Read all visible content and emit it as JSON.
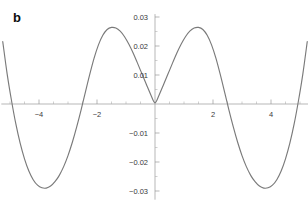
{
  "panel": {
    "label": "b"
  },
  "chart_data": {
    "type": "line",
    "title": "",
    "xlabel": "",
    "ylabel": "",
    "xlim": [
      -5.3,
      5.3
    ],
    "ylim": [
      -0.033,
      0.031
    ],
    "grid": false,
    "legend": null,
    "xticks": [
      -4,
      -2,
      2,
      4
    ],
    "xtick_labels": [
      "−4",
      "−2",
      "2",
      "4"
    ],
    "xtick_minor_step": 0.5,
    "yticks": [
      0.03,
      0.02,
      0.01,
      -0.01,
      -0.02,
      -0.03
    ],
    "ytick_labels": [
      "0.03",
      "0.02",
      "0.01",
      "−0.01",
      "−0.02",
      "−0.03"
    ],
    "ytick_minor_step": 0.005,
    "axis_color": "#9a9a9a",
    "curve_color": "#7a7a7a",
    "series": [
      {
        "name": "curve",
        "x": [
          -5.25,
          -5.1,
          -4.95,
          -4.8,
          -4.65,
          -4.5,
          -4.35,
          -4.2,
          -4.05,
          -3.9,
          -3.75,
          -3.6,
          -3.45,
          -3.3,
          -3.15,
          -3.0,
          -2.85,
          -2.7,
          -2.55,
          -2.4,
          -2.25,
          -2.1,
          -1.95,
          -1.8,
          -1.65,
          -1.5,
          -1.35,
          -1.2,
          -1.05,
          -0.9,
          -0.75,
          -0.6,
          -0.45,
          -0.3,
          -0.15,
          0.0,
          0.15,
          0.3,
          0.45,
          0.6,
          0.75,
          0.9,
          1.05,
          1.2,
          1.35,
          1.5,
          1.65,
          1.8,
          1.95,
          2.1,
          2.25,
          2.4,
          2.55,
          2.7,
          2.85,
          3.0,
          3.15,
          3.3,
          3.45,
          3.6,
          3.75,
          3.9,
          4.05,
          4.2,
          4.35,
          4.5,
          4.65,
          4.8,
          4.95,
          5.1,
          5.25
        ],
        "y": [
          0.0215,
          0.0105,
          0.0013,
          -0.0068,
          -0.0135,
          -0.0189,
          -0.0231,
          -0.0261,
          -0.028,
          -0.0289,
          -0.029,
          -0.0283,
          -0.0268,
          -0.0246,
          -0.0216,
          -0.0178,
          -0.0132,
          -0.0079,
          -0.0021,
          0.0041,
          0.0102,
          0.0158,
          0.0204,
          0.0237,
          0.0257,
          0.0264,
          0.0262,
          0.0251,
          0.0232,
          0.0206,
          0.0175,
          0.014,
          0.0104,
          0.0068,
          0.0033,
          0.0004,
          0.0033,
          0.0068,
          0.0104,
          0.014,
          0.0175,
          0.0206,
          0.0232,
          0.0251,
          0.0262,
          0.0264,
          0.0257,
          0.0237,
          0.0204,
          0.0158,
          0.0102,
          0.0041,
          -0.0021,
          -0.0079,
          -0.0132,
          -0.0178,
          -0.0216,
          -0.0246,
          -0.0268,
          -0.0283,
          -0.029,
          -0.0289,
          -0.028,
          -0.0261,
          -0.0231,
          -0.0189,
          -0.0135,
          -0.0068,
          0.0013,
          0.0105,
          0.0215
        ]
      }
    ],
    "annotations": [
      {
        "text": "b",
        "x_px": 17,
        "y_px": 22,
        "bold": true
      }
    ]
  }
}
